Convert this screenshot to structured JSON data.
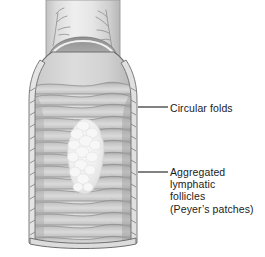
{
  "figure": {
    "background_color": "#ffffff"
  },
  "callouts": [
    {
      "id": "circular-folds",
      "lines": [
        "Circular folds"
      ],
      "text_color": "#1b1b1b",
      "leader": {
        "x1": 138,
        "y1": 107,
        "x2": 168,
        "y2": 107
      }
    },
    {
      "id": "peyers-patches",
      "lines": [
        "Aggregated",
        "lymphatic",
        "follicles",
        "(Peyer’s patches)"
      ],
      "text_color": "#1b1b1b",
      "leader": {
        "x1": 138,
        "y1": 172,
        "x2": 168,
        "y2": 172
      }
    }
  ],
  "anatomy": {
    "serosa_color": "#cfcfcf",
    "wall_outline_color": "#6e6e6e",
    "lumen_color": "#bdbdbd",
    "fold_light_color": "#d9d9d9",
    "fold_shadow_color": "#9d9d9d",
    "deep_shadow_color": "#8a8a8a",
    "vessel_color": "#909090",
    "peyers_patch_color": "#f1f1f1",
    "peyers_patch_edge_color": "#d2d2d2",
    "fold_count": 14,
    "vessel_branch_count": 2
  }
}
